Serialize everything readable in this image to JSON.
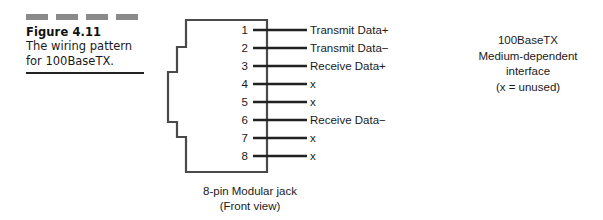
{
  "figure": {
    "dash_count": 4,
    "number_label": "Figure 4.11",
    "caption_line1": "The wiring pattern",
    "caption_line2": "for 100BaseTX."
  },
  "jack": {
    "caption_line1": "8-pin Modular jack",
    "caption_line2": "(Front view)",
    "outline_color": "#4a4a4a",
    "lead_color": "#222222",
    "pins": [
      {
        "number": "1",
        "signal": "Transmit Data+"
      },
      {
        "number": "2",
        "signal": "Transmit Data−"
      },
      {
        "number": "3",
        "signal": "Receive Data+"
      },
      {
        "number": "4",
        "signal": "x"
      },
      {
        "number": "5",
        "signal": "x"
      },
      {
        "number": "6",
        "signal": "Receive Data−"
      },
      {
        "number": "7",
        "signal": "x"
      },
      {
        "number": "8",
        "signal": "x"
      }
    ]
  },
  "note": {
    "line1": "100BaseTX",
    "line2": "Medium-dependent",
    "line3": "interface",
    "line4": "(x = unused)"
  },
  "colors": {
    "dash": "#8a8a8a",
    "rule": "#222222",
    "text": "#1a1a1a",
    "background": "#ffffff"
  }
}
